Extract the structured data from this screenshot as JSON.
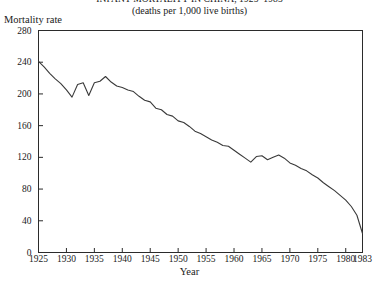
{
  "title": {
    "line1": "INFANT MORTALITY IN CHINA, 1925–1983",
    "line2": "(deaths per 1,000 live births)"
  },
  "axes": {
    "ylabel": "Mortality rate",
    "xlabel": "Year",
    "yticks": [
      0,
      40,
      80,
      120,
      160,
      200,
      240,
      280
    ],
    "xticks": [
      1925,
      1930,
      1935,
      1940,
      1945,
      1950,
      1955,
      1960,
      1965,
      1970,
      1975,
      1980,
      1983
    ]
  },
  "style": {
    "line_color": "#3a3a3a",
    "axis_color": "#2b2b2b",
    "background": "#ffffff"
  },
  "chart_data": {
    "type": "line",
    "title": "INFANT MORTALITY IN CHINA, 1925–1983",
    "subtitle": "(deaths per 1,000 live births)",
    "xlabel": "Year",
    "ylabel": "Mortality rate",
    "xlim": [
      1925,
      1983
    ],
    "ylim": [
      0,
      280
    ],
    "grid": false,
    "legend": "none",
    "series": [
      {
        "name": "Infant mortality rate",
        "x": [
          1925,
          1926,
          1927,
          1928,
          1929,
          1930,
          1931,
          1932,
          1933,
          1934,
          1935,
          1936,
          1937,
          1938,
          1939,
          1940,
          1941,
          1942,
          1943,
          1944,
          1945,
          1946,
          1947,
          1948,
          1949,
          1950,
          1951,
          1952,
          1953,
          1954,
          1955,
          1956,
          1957,
          1958,
          1959,
          1960,
          1961,
          1962,
          1963,
          1964,
          1965,
          1966,
          1967,
          1968,
          1969,
          1970,
          1971,
          1972,
          1973,
          1974,
          1975,
          1976,
          1977,
          1978,
          1979,
          1980,
          1981,
          1982,
          1983
        ],
        "y": [
          241,
          234,
          226,
          219,
          213,
          205,
          196,
          212,
          214,
          198,
          214,
          216,
          222,
          215,
          210,
          208,
          205,
          203,
          197,
          192,
          190,
          182,
          180,
          174,
          172,
          166,
          164,
          159,
          153,
          150,
          146,
          142,
          139,
          135,
          134,
          129,
          124,
          119,
          114,
          121,
          122,
          117,
          120,
          123,
          119,
          113,
          110,
          106,
          103,
          98,
          94,
          88,
          83,
          78,
          72,
          66,
          58,
          47,
          24
        ]
      }
    ]
  }
}
